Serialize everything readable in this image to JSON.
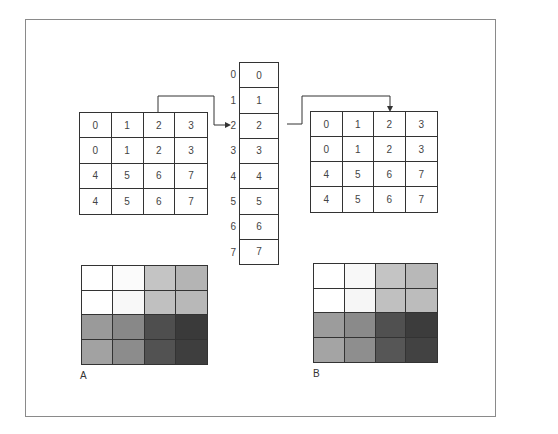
{
  "figure": {
    "left_grid": {
      "cells": [
        "0",
        "1",
        "2",
        "3",
        "0",
        "1",
        "2",
        "3",
        "4",
        "5",
        "6",
        "7",
        "4",
        "5",
        "6",
        "7"
      ]
    },
    "lookup_table": {
      "indices": [
        "0",
        "1",
        "2",
        "3",
        "4",
        "5",
        "6",
        "7"
      ],
      "values": [
        "0",
        "1",
        "2",
        "3",
        "4",
        "5",
        "6",
        "7"
      ]
    },
    "right_grid": {
      "cells": [
        "0",
        "1",
        "2",
        "3",
        "0",
        "1",
        "2",
        "3",
        "4",
        "5",
        "6",
        "7",
        "4",
        "5",
        "6",
        "7"
      ]
    },
    "shaded_grid_a": {
      "label": "A",
      "fills": [
        "#ffffff",
        "#fbfbfb",
        "#c4c4c4",
        "#b4b4b4",
        "#ffffff",
        "#f8f8f8",
        "#c0c0c0",
        "#b8b8b8",
        "#9a9a9a",
        "#888888",
        "#4e4e4e",
        "#3a3a3a",
        "#a2a2a2",
        "#8c8c8c",
        "#525252",
        "#3e3e3e"
      ]
    },
    "shaded_grid_b": {
      "label": "B",
      "fills": [
        "#ffffff",
        "#f8f8f8",
        "#c4c4c4",
        "#b8b8b8",
        "#ffffff",
        "#f6f6f6",
        "#c0c0c0",
        "#bcbcbc",
        "#9c9c9c",
        "#8a8a8a",
        "#505050",
        "#3c3c3c",
        "#a4a4a4",
        "#8e8e8e",
        "#565656",
        "#424242"
      ]
    }
  }
}
